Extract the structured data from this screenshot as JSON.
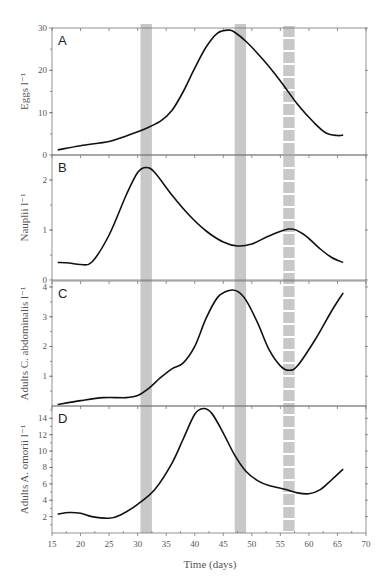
{
  "chart_data": {
    "type": "line",
    "xlabel": "Time (days)",
    "xlim": [
      15,
      70
    ],
    "xticks": [
      15,
      20,
      25,
      30,
      35,
      40,
      45,
      50,
      55,
      60,
      65,
      70
    ],
    "shaded_periods": [
      {
        "start": 30.5,
        "end": 32.5,
        "style": "solid"
      },
      {
        "start": 47,
        "end": 49,
        "style": "solid"
      },
      {
        "start": 55.5,
        "end": 57.5,
        "style": "dashed"
      }
    ],
    "shade_color": "#c8c8c8",
    "panels": [
      {
        "letter": "A",
        "ylabel": "Eggs l⁻¹",
        "ylim": [
          0,
          30
        ],
        "yticks": [
          0,
          10,
          20,
          30
        ],
        "x": [
          16,
          20,
          25,
          28,
          31,
          34,
          36,
          38,
          40,
          42,
          44,
          46,
          47,
          49,
          52,
          55,
          58,
          61,
          63,
          65,
          66
        ],
        "y": [
          1.2,
          2.2,
          3.2,
          4.5,
          6.0,
          8.0,
          10.5,
          15,
          20.5,
          25.5,
          28.8,
          29.5,
          29.0,
          26.8,
          22.5,
          17.5,
          12.0,
          7.5,
          5.2,
          4.6,
          4.7
        ]
      },
      {
        "letter": "B",
        "ylabel": "Nauplii l⁻¹",
        "ylim": [
          0,
          2.5
        ],
        "yticks": [
          0,
          1,
          2
        ],
        "x": [
          16,
          18,
          20,
          22,
          25,
          28,
          30,
          31.5,
          33,
          36,
          39,
          42,
          45,
          47.5,
          50,
          53,
          56.5,
          59,
          62,
          64,
          66
        ],
        "y": [
          0.35,
          0.34,
          0.31,
          0.36,
          0.9,
          1.7,
          2.15,
          2.25,
          2.15,
          1.7,
          1.3,
          0.98,
          0.76,
          0.68,
          0.72,
          0.88,
          1.02,
          0.92,
          0.62,
          0.45,
          0.35
        ]
      },
      {
        "letter": "C",
        "ylabel": "Adults C. abdominalis l⁻¹",
        "ylim": [
          0,
          4.2
        ],
        "yticks": [
          1,
          2,
          3,
          4
        ],
        "x": [
          16,
          20,
          24,
          28,
          30,
          32,
          34,
          36,
          38,
          40,
          42,
          44,
          46,
          47.5,
          49,
          51,
          53,
          55,
          56.5,
          58,
          61,
          64,
          66
        ],
        "y": [
          0.05,
          0.18,
          0.28,
          0.28,
          0.35,
          0.6,
          0.95,
          1.25,
          1.45,
          2.0,
          2.95,
          3.65,
          3.88,
          3.85,
          3.55,
          2.8,
          1.9,
          1.35,
          1.2,
          1.35,
          2.2,
          3.2,
          3.8
        ]
      },
      {
        "letter": "D",
        "ylabel": "Adults A. omorii l⁻¹",
        "ylim": [
          0,
          15.5
        ],
        "yticks": [
          2,
          4,
          6,
          8,
          10,
          12,
          14
        ],
        "x": [
          16,
          18,
          20,
          22,
          25,
          27,
          30,
          33,
          36,
          38,
          40,
          41.5,
          43,
          45,
          47,
          49,
          51,
          53,
          56,
          58,
          60,
          62,
          64,
          66
        ],
        "y": [
          2.3,
          2.5,
          2.4,
          2.0,
          1.8,
          2.2,
          3.5,
          5.3,
          8.5,
          11.5,
          14.5,
          15.2,
          14.6,
          12.2,
          9.5,
          7.5,
          6.4,
          5.8,
          5.3,
          4.9,
          4.8,
          5.3,
          6.5,
          7.8
        ]
      }
    ]
  }
}
